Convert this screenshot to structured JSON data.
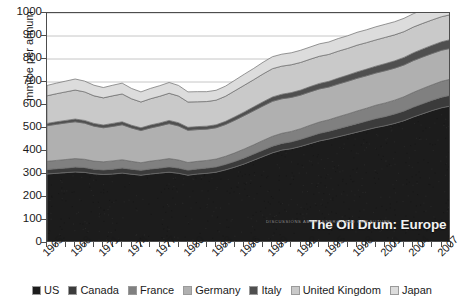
{
  "chart_data": {
    "type": "area",
    "stacked": true,
    "title": "",
    "xlabel": "",
    "ylabel": "mmtoe per annum",
    "ylim": [
      0,
      1000
    ],
    "yticks": [
      0,
      100,
      200,
      300,
      400,
      500,
      600,
      700,
      800,
      900,
      1000
    ],
    "grid": true,
    "legend_position": "bottom",
    "xlim": [
      1965,
      2008
    ],
    "x": [
      1965,
      1966,
      1967,
      1968,
      1969,
      1970,
      1971,
      1972,
      1973,
      1974,
      1975,
      1976,
      1977,
      1978,
      1979,
      1980,
      1981,
      1982,
      1983,
      1984,
      1985,
      1986,
      1987,
      1988,
      1989,
      1990,
      1991,
      1992,
      1993,
      1994,
      1995,
      1996,
      1997,
      1998,
      1999,
      2000,
      2001,
      2002,
      2003,
      2004,
      2005,
      2006,
      2007,
      2008
    ],
    "xtick_labels": [
      "1965",
      "1968",
      "1971",
      "1974",
      "1977",
      "1980",
      "1983",
      "1986",
      "1989",
      "1992",
      "1995",
      "1998",
      "2001",
      "2004",
      "2007"
    ],
    "xtick_values": [
      1965,
      1968,
      1971,
      1974,
      1977,
      1980,
      1983,
      1986,
      1989,
      1992,
      1995,
      1998,
      2001,
      2004,
      2007
    ],
    "series": [
      {
        "name": "US",
        "color": "#1c1c1c",
        "values": [
          300,
          303,
          306,
          309,
          307,
          301,
          298,
          300,
          304,
          299,
          295,
          300,
          304,
          308,
          303,
          295,
          300,
          303,
          308,
          318,
          330,
          344,
          360,
          376,
          392,
          404,
          410,
          420,
          432,
          444,
          452,
          462,
          472,
          482,
          492,
          502,
          510,
          520,
          532,
          548,
          562,
          576,
          588,
          596
        ]
      },
      {
        "name": "Canada",
        "color": "#3b3b3b",
        "values": [
          20,
          20,
          20,
          21,
          21,
          20,
          20,
          21,
          22,
          22,
          21,
          22,
          22,
          23,
          23,
          22,
          22,
          23,
          23,
          24,
          25,
          26,
          27,
          28,
          29,
          29,
          30,
          31,
          32,
          33,
          34,
          35,
          36,
          37,
          38,
          39,
          40,
          41,
          42,
          43,
          44,
          45,
          46,
          47
        ]
      },
      {
        "name": "France",
        "color": "#808080",
        "values": [
          35,
          36,
          37,
          37,
          36,
          35,
          35,
          36,
          36,
          34,
          33,
          34,
          35,
          36,
          35,
          33,
          33,
          33,
          34,
          35,
          37,
          39,
          40,
          42,
          43,
          44,
          45,
          46,
          48,
          49,
          50,
          52,
          53,
          55,
          56,
          58,
          59,
          60,
          62,
          64,
          66,
          67,
          69,
          70
        ]
      },
      {
        "name": "Germany",
        "color": "#b0b0b0",
        "values": [
          155,
          157,
          159,
          160,
          157,
          152,
          148,
          150,
          152,
          145,
          140,
          144,
          148,
          152,
          148,
          140,
          138,
          136,
          136,
          138,
          142,
          145,
          148,
          150,
          152,
          150,
          148,
          146,
          145,
          144,
          142,
          142,
          142,
          142,
          141,
          140,
          140,
          139,
          138,
          138,
          137,
          136,
          135,
          134
        ]
      },
      {
        "name": "Italy",
        "color": "#4f4f4f",
        "values": [
          10,
          11,
          11,
          12,
          12,
          12,
          12,
          13,
          13,
          12,
          12,
          13,
          13,
          14,
          14,
          13,
          13,
          13,
          13,
          14,
          15,
          16,
          17,
          18,
          19,
          20,
          21,
          22,
          23,
          24,
          25,
          26,
          27,
          28,
          29,
          30,
          31,
          32,
          33,
          34,
          35,
          36,
          37,
          38
        ]
      },
      {
        "name": "United Kingdom",
        "color": "#c9c9c9",
        "values": [
          120,
          122,
          124,
          126,
          124,
          120,
          118,
          120,
          121,
          115,
          112,
          114,
          116,
          118,
          116,
          110,
          108,
          107,
          107,
          109,
          113,
          116,
          118,
          121,
          123,
          122,
          121,
          120,
          119,
          118,
          117,
          117,
          116,
          116,
          115,
          114,
          114,
          113,
          112,
          112,
          111,
          110,
          109,
          108
        ]
      },
      {
        "name": "Japan",
        "color": "#dcdcdc",
        "values": [
          45,
          46,
          47,
          48,
          47,
          46,
          45,
          46,
          47,
          45,
          44,
          45,
          46,
          47,
          46,
          44,
          44,
          43,
          43,
          44,
          46,
          48,
          49,
          51,
          52,
          52,
          52,
          53,
          53,
          54,
          54,
          55,
          55,
          56,
          56,
          57,
          57,
          57,
          58,
          58,
          59,
          59,
          60,
          60
        ]
      }
    ]
  },
  "axis": {
    "ylabel": "mmtoe per annum"
  },
  "watermark": {
    "text": "The Oil Drum: Europe",
    "subtext": "DISCUSSIONS ABOUT ENERGY AND OUR FUTURE"
  },
  "legend": {
    "items": [
      {
        "label": "US",
        "color": "#1c1c1c"
      },
      {
        "label": "Canada",
        "color": "#3b3b3b"
      },
      {
        "label": "France",
        "color": "#808080"
      },
      {
        "label": "Germany",
        "color": "#b0b0b0"
      },
      {
        "label": "Italy",
        "color": "#4f4f4f"
      },
      {
        "label": "United Kingdom",
        "color": "#c9c9c9"
      },
      {
        "label": "Japan",
        "color": "#dcdcdc"
      }
    ]
  }
}
